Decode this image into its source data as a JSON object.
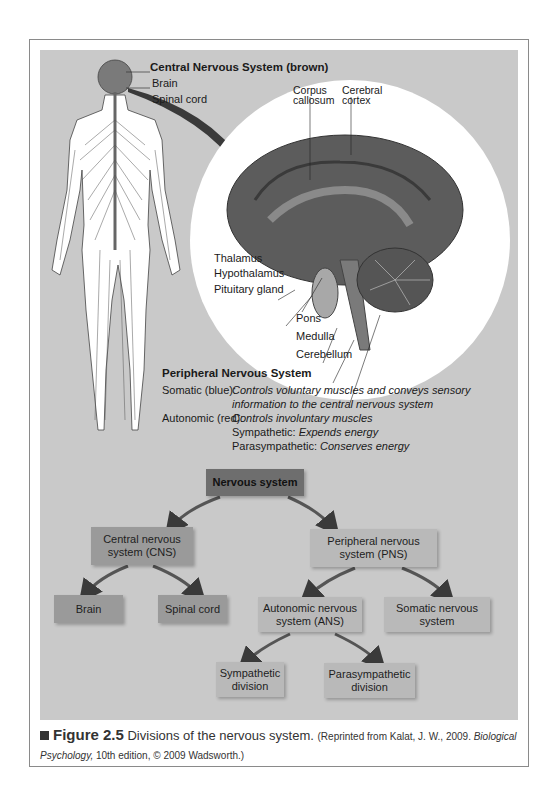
{
  "cns": {
    "heading": "Central Nervous System (brown)",
    "brain": "Brain",
    "spinal_cord": "Spinal cord"
  },
  "brain_labels": {
    "corpus_callosum_1": "Corpus",
    "corpus_callosum_2": "callosum",
    "cerebral_cortex_1": "Cerebral",
    "cerebral_cortex_2": "cortex",
    "thalamus": "Thalamus",
    "hypothalamus": "Hypothalamus",
    "pituitary": "Pituitary gland",
    "pons": "Pons",
    "medulla": "Medulla",
    "cerebellum": "Cerebellum"
  },
  "pns": {
    "heading": "Peripheral Nervous System",
    "somatic_label": "Somatic (blue):",
    "somatic_desc_1": "Controls voluntary muscles and conveys sensory",
    "somatic_desc_2": "information to the central nervous system",
    "autonomic_label": "Autonomic (red):",
    "autonomic_desc": "Controls involuntary muscles",
    "sympathetic_label": "Sympathetic:",
    "sympathetic_desc": "Expends energy",
    "parasympathetic_label": "Parasympathetic:",
    "parasympathetic_desc": "Conserves energy"
  },
  "tree": {
    "root": "Nervous system",
    "cns_1": "Central nervous",
    "cns_2": "system (CNS)",
    "pns_1": "Peripheral nervous",
    "pns_2": "system (PNS)",
    "brain": "Brain",
    "spinal_cord": "Spinal cord",
    "ans_1": "Autonomic nervous",
    "ans_2": "system (ANS)",
    "somatic_1": "Somatic nervous",
    "somatic_2": "system",
    "symp_1": "Sympathetic",
    "symp_2": "division",
    "para_1": "Parasympathetic",
    "para_2": "division"
  },
  "caption": {
    "figure": "Figure 2.5",
    "title": "Divisions of the nervous system.",
    "source_1": "(Reprinted from Kalat, J. W., 2009.",
    "source_book": "Biological Psychology,",
    "source_2": "10th edition, © 2009 Wadsworth.)"
  }
}
